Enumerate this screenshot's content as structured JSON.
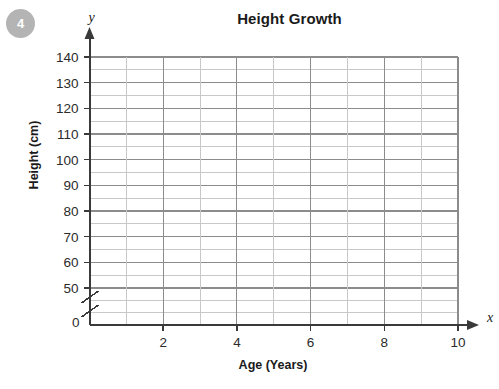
{
  "badge": {
    "label": "4"
  },
  "chart_data": {
    "type": "line",
    "title": "Height Growth",
    "xlabel": "Age (Years)",
    "ylabel": "Height (cm)",
    "x_axis_letter": "x",
    "y_axis_letter": "y",
    "xlim": [
      0,
      10
    ],
    "ylim": [
      50,
      140
    ],
    "y_axis_break": true,
    "y_break_from": 0,
    "y_break_to": 50,
    "origin_label": "0",
    "x_ticks": [
      0,
      2,
      4,
      6,
      8,
      10
    ],
    "x_tick_labels": [
      "",
      "2",
      "4",
      "6",
      "8",
      "10"
    ],
    "x_minor_step": 1,
    "x_major_step": 2,
    "y_ticks": [
      50,
      60,
      70,
      80,
      90,
      100,
      110,
      120,
      130,
      140
    ],
    "y_tick_labels": [
      "50",
      "60",
      "70",
      "80",
      "90",
      "100",
      "110",
      "120",
      "130",
      "140"
    ],
    "y_minor_step": 5,
    "y_major_step": 10,
    "grid": true,
    "legend": "none",
    "series": [],
    "values": [],
    "categories": [],
    "note": "Empty plotting grid - no data plotted",
    "colors": {
      "grid_major": "#8c8c8c",
      "grid_minor": "#c8c8c8",
      "axis": "#3a3a3a",
      "text": "#1a1a1a",
      "badge": "#b4b4b4",
      "background": "#ffffff"
    }
  }
}
